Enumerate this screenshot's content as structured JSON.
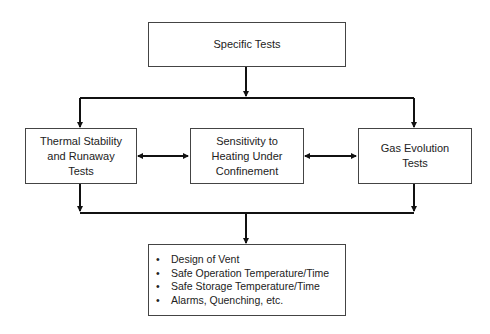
{
  "diagram": {
    "top": {
      "label": "Specific Tests"
    },
    "middle": [
      {
        "label": "Thermal Stability and Runaway Tests"
      },
      {
        "label": "Sensitivity to Heating Under Confinement"
      },
      {
        "label": "Gas Evolution Tests"
      }
    ],
    "bottom": {
      "items": [
        "Design of Vent",
        "Safe Operation Temperature/Time",
        "Safe Storage Temperature/Time",
        "Alarms, Quenching, etc."
      ]
    }
  }
}
